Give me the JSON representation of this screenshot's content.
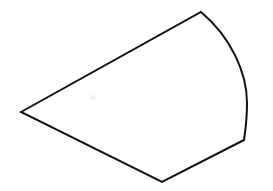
{
  "canvas": {
    "width": 273,
    "height": 191,
    "background_color": "#ffffff",
    "title": "Curved sector quadrilateral line drawing"
  },
  "shape": {
    "name": "circular-sector-like-quadrilateral",
    "stroke_color": "#111111",
    "fill_color": "#ffffff",
    "stroke_width": 2,
    "vertices": [
      {
        "label": "left-apex",
        "x": 21,
        "y": 112
      },
      {
        "label": "top-right",
        "x": 201,
        "y": 12
      },
      {
        "label": "right-lower",
        "x": 244,
        "y": 140
      },
      {
        "label": "bottom",
        "x": 162,
        "y": 182
      }
    ],
    "edges": [
      {
        "label": "upper-left-edge",
        "type": "line",
        "from": "left-apex",
        "to": "top-right"
      },
      {
        "label": "right-arc-edge",
        "type": "curve",
        "from": "top-right",
        "to": "right-lower",
        "bulge_direction": "right",
        "max_x": 247,
        "max_x_at_y": 100
      },
      {
        "label": "lower-right-edge",
        "type": "line",
        "from": "right-lower",
        "to": "bottom"
      },
      {
        "label": "lower-left-edge",
        "type": "line",
        "from": "bottom",
        "to": "left-apex"
      }
    ],
    "path": "M 21 112 L 201 12 C 232 38 247 74 247 103 C 247 117 245.5 130 244 140 L 162 182 Z"
  },
  "artifacts": [
    {
      "name": "faint-smudge",
      "x": 89,
      "y": 95
    }
  ]
}
